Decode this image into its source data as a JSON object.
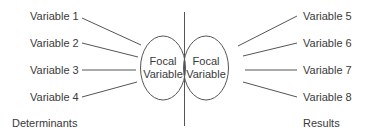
{
  "diagram": {
    "type": "determinants-results model",
    "left_focal": {
      "line1": "Focal",
      "line2": "Variable"
    },
    "right_focal": {
      "line1": "Focal",
      "line2": "Variable"
    },
    "determinants": [
      {
        "label": "Variable 1"
      },
      {
        "label": "Variable 2"
      },
      {
        "label": "Variable 3"
      },
      {
        "label": "Variable 4"
      }
    ],
    "results": [
      {
        "label": "Variable 5"
      },
      {
        "label": "Variable 6"
      },
      {
        "label": "Variable 7"
      },
      {
        "label": "Variable 8"
      }
    ],
    "left_caption": "Determinants",
    "right_caption": "Results",
    "colors": {
      "stroke": "#555555",
      "text": "#3a3a3a",
      "background": "#ffffff"
    }
  }
}
